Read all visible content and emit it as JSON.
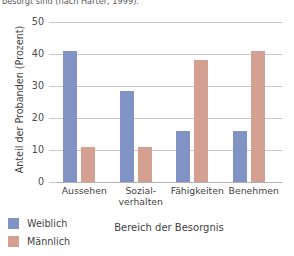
{
  "caption": {
    "text": "besorgt sind (nach Harter, 1999)."
  },
  "chart_data": {
    "type": "bar",
    "title": "",
    "subtitle": "",
    "xlabel": "Bereich der Besorgnis",
    "ylabel": "Anteil der Probanden (Prozent)",
    "categories": [
      "Aussehen",
      "Sozial-\nverhalten",
      "Fähigkeiten",
      "Benehmen"
    ],
    "category_lines": [
      [
        "Aussehen"
      ],
      [
        "Sozial-",
        "verhalten"
      ],
      [
        "Fähigkeiten"
      ],
      [
        "Benehmen"
      ]
    ],
    "series": [
      {
        "name": "Weiblich",
        "color": "#8093c4",
        "values": [
          41,
          28.5,
          16,
          16
        ]
      },
      {
        "name": "Männlich",
        "color": "#d4a092",
        "values": [
          11,
          11,
          38,
          41
        ]
      }
    ],
    "ylim": [
      0,
      50
    ],
    "yticks": [
      0,
      10,
      20,
      30,
      40,
      50
    ],
    "ytick_labels": [
      "0",
      "10",
      "20",
      "30",
      "40",
      "50"
    ],
    "grid": true,
    "legend_position": "bottom-left",
    "legend_entries": [
      {
        "label": "Weiblich",
        "color": "#8093c4"
      },
      {
        "label": "Männlich",
        "color": "#d4a092"
      }
    ]
  }
}
